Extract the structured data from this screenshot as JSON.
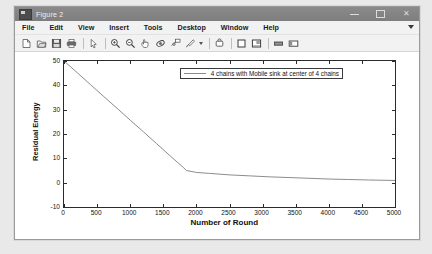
{
  "window": {
    "title": "Figure 2",
    "icon": "figure-icon",
    "buttons": {
      "minimize": "minimize-icon",
      "maximize": "maximize-icon",
      "close": "close-icon"
    }
  },
  "menubar": {
    "items": [
      {
        "label": "File"
      },
      {
        "label": "Edit"
      },
      {
        "label": "View"
      },
      {
        "label": "Insert"
      },
      {
        "label": "Tools"
      },
      {
        "label": "Desktop"
      },
      {
        "label": "Window"
      },
      {
        "label": "Help"
      }
    ],
    "overflow": "chevron-down-icon"
  },
  "toolbar": {
    "buttons": [
      {
        "name": "new-figure-icon"
      },
      {
        "name": "open-file-icon"
      },
      {
        "name": "save-figure-icon"
      },
      {
        "name": "print-figure-icon"
      },
      {
        "name": "edit-plot-pointer-icon"
      },
      {
        "name": "zoom-in-icon"
      },
      {
        "name": "zoom-out-icon"
      },
      {
        "name": "pan-icon"
      },
      {
        "name": "rotate-3d-icon"
      },
      {
        "name": "data-cursor-icon"
      },
      {
        "name": "brush-select-icon"
      },
      {
        "name": "link-plot-icon"
      },
      {
        "name": "colorbar-icon"
      },
      {
        "name": "insert-legend-icon"
      },
      {
        "name": "hide-plot-tools-icon"
      },
      {
        "name": "show-plot-tools-icon"
      }
    ]
  },
  "chart_data": {
    "type": "line",
    "title": "",
    "xlabel": "Number of Round",
    "ylabel": "Residual Energy",
    "xlim": [
      0,
      5000
    ],
    "ylim": [
      -10,
      50
    ],
    "xticks": [
      0,
      500,
      1000,
      1500,
      2000,
      2500,
      3000,
      3500,
      4000,
      4500,
      5000
    ],
    "xticklabels": [
      "0",
      "500",
      "1000",
      "1500",
      "2000",
      "2500",
      "3000",
      "3500",
      "4000",
      "4500",
      "5000"
    ],
    "yticks": [
      -10,
      0,
      10,
      20,
      30,
      40,
      50
    ],
    "yticklabels": [
      "-10",
      "0",
      "10",
      "20",
      "30",
      "40",
      "50"
    ],
    "grid": false,
    "legend": {
      "position": "top-center-right",
      "entries": [
        {
          "name": "4 chains with Mobile sink at center of 4 chains",
          "color": "#8c8c8c"
        }
      ]
    },
    "series": [
      {
        "name": "4 chains with Mobile sink at center of 4 chains",
        "color": "#8c8c8c",
        "x": [
          0,
          200,
          400,
          600,
          800,
          1000,
          1200,
          1400,
          1600,
          1800,
          1850,
          2000,
          2200,
          2500,
          2800,
          3100,
          3400,
          3700,
          4000,
          4300,
          4600,
          5000
        ],
        "y": [
          50.0,
          45.2,
          40.3,
          35.4,
          30.6,
          25.7,
          20.9,
          16.0,
          11.1,
          6.3,
          5.0,
          4.2,
          3.8,
          3.2,
          2.8,
          2.4,
          2.1,
          1.8,
          1.5,
          1.3,
          1.1,
          0.9
        ]
      }
    ]
  },
  "colors": {
    "titlebar": "#7e7e7e",
    "window_bg": "#f0f0f0",
    "canvas": "#ffffff",
    "axis": "#2b2b2b",
    "line": "#8c8c8c"
  }
}
